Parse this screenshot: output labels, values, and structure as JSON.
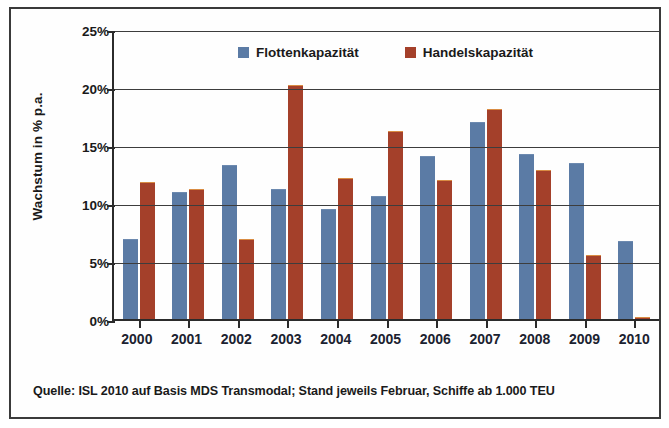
{
  "chart_data": {
    "type": "bar",
    "title": "",
    "xlabel": "",
    "ylabel": "Wachstum in % p.a.",
    "ylim": [
      0,
      25
    ],
    "ytick_labels": [
      "25%",
      "20%",
      "15%",
      "10%",
      "5%",
      "0%"
    ],
    "ytick_values": [
      25,
      20,
      15,
      10,
      5,
      0
    ],
    "grid": true,
    "legend_position": "top-center",
    "categories": [
      "2000",
      "2001",
      "2002",
      "2003",
      "2004",
      "2005",
      "2006",
      "2007",
      "2008",
      "2009",
      "2010"
    ],
    "series": [
      {
        "name": "Flottenkapazität",
        "color": "#5b7ba5",
        "values": [
          7.0,
          11.0,
          13.4,
          11.3,
          9.6,
          10.7,
          14.1,
          17.1,
          14.3,
          13.5,
          6.8
        ]
      },
      {
        "name": "Handelskapazität",
        "color": "#a4402a",
        "values": [
          11.9,
          11.3,
          7.0,
          20.3,
          12.2,
          16.3,
          12.1,
          18.2,
          12.9,
          5.6,
          0.3
        ]
      }
    ],
    "source_note": "Quelle: ISL 2010 auf Basis MDS Transmodal; Stand jeweils Februar, Schiffe ab 1.000 TEU"
  }
}
